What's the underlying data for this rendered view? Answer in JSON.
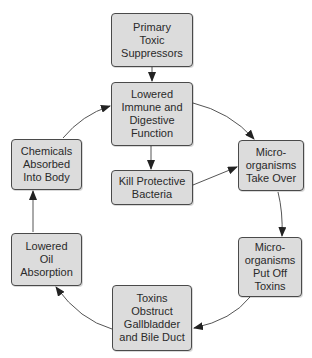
{
  "diagram": {
    "type": "cycle-flowchart",
    "colors": {
      "node_fill": "#dcdcdc",
      "node_border": "#4a4a4a",
      "edge": "#555555",
      "text": "#2a2a2a"
    },
    "nodes": {
      "primary": {
        "label": "Primary Toxic Suppressors",
        "lines": [
          "Primary",
          "Toxic",
          "Suppressors"
        ]
      },
      "immune": {
        "label": "Lowered Immune and Digestive Function",
        "lines": [
          "Lowered",
          "Immune and",
          "Digestive",
          "Function"
        ]
      },
      "kill": {
        "label": "Kill Protective Bacteria",
        "lines": [
          "Kill Protective",
          "Bacteria"
        ]
      },
      "takeover": {
        "label": "Micro-organisms Take Over",
        "lines": [
          "Micro-",
          "organisms",
          "Take Over"
        ]
      },
      "putoff": {
        "label": "Micro-organisms Put Off Toxins",
        "lines": [
          "Micro-",
          "organisms",
          "Put Off",
          "Toxins"
        ]
      },
      "toxins": {
        "label": "Toxins Obstruct Gallbladder and Bile Duct",
        "lines": [
          "Toxins",
          "Obstruct",
          "Gallbladder",
          "and Bile Duct"
        ]
      },
      "oil": {
        "label": "Lowered Oil Absorption",
        "lines": [
          "Lowered",
          "Oil",
          "Absorption"
        ]
      },
      "chemicals": {
        "label": "Chemicals Absorbed Into Body",
        "lines": [
          "Chemicals",
          "Absorbed",
          "Into Body"
        ]
      }
    },
    "edges": [
      {
        "from": "Primary Toxic Suppressors",
        "to": "Lowered Immune and Digestive Function"
      },
      {
        "from": "Lowered Immune and Digestive Function",
        "to": "Kill Protective Bacteria"
      },
      {
        "from": "Lowered Immune and Digestive Function",
        "to": "Micro-organisms Take Over"
      },
      {
        "from": "Kill Protective Bacteria",
        "to": "Micro-organisms Take Over"
      },
      {
        "from": "Micro-organisms Take Over",
        "to": "Micro-organisms Put Off Toxins"
      },
      {
        "from": "Micro-organisms Put Off Toxins",
        "to": "Toxins Obstruct Gallbladder and Bile Duct"
      },
      {
        "from": "Toxins Obstruct Gallbladder and Bile Duct",
        "to": "Lowered Oil Absorption"
      },
      {
        "from": "Lowered Oil Absorption",
        "to": "Chemicals Absorbed Into Body"
      },
      {
        "from": "Chemicals Absorbed Into Body",
        "to": "Lowered Immune and Digestive Function"
      }
    ]
  }
}
